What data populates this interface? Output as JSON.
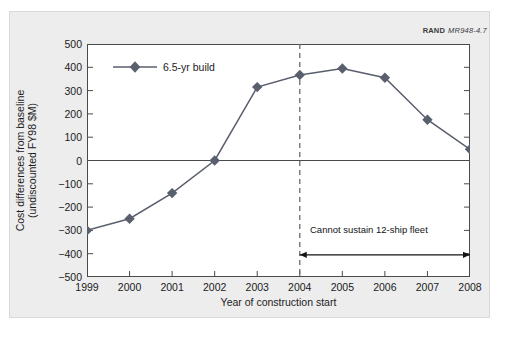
{
  "figure": {
    "credit_org": "RAND",
    "credit_number": "MR948-4.7",
    "background_color": "#ededed",
    "plot_background_color": "#ffffff"
  },
  "chart_data": {
    "type": "line",
    "title": "",
    "xlabel": "Year of construction start",
    "ylabel": "Cost differences from baseline (undiscounted FY98 $M)",
    "ylabel_line1": "Cost differences from baseline",
    "ylabel_line2": "(undiscounted FY98 $M)",
    "categories": [
      "1999",
      "2000",
      "2001",
      "2002",
      "2003",
      "2004",
      "2005",
      "2006",
      "2007",
      "2008"
    ],
    "x": [
      1999,
      2000,
      2001,
      2002,
      2003,
      2004,
      2005,
      2006,
      2007,
      2008
    ],
    "series": [
      {
        "name": "6.5-yr build",
        "values": [
          -300,
          -250,
          -140,
          0,
          315,
          367,
          395,
          355,
          175,
          48
        ],
        "color": "#5a5f6e",
        "marker": "diamond"
      }
    ],
    "ylim": [
      -500,
      500
    ],
    "yticks": [
      500,
      400,
      300,
      200,
      100,
      0,
      -100,
      -200,
      -300,
      -400,
      -500
    ],
    "ytick_labels": [
      "500",
      "400",
      "300",
      "200",
      "100",
      "0",
      "−100",
      "−200",
      "−300",
      "−400",
      "−500"
    ],
    "xlim": [
      1999,
      2008
    ],
    "xticks": [
      1999,
      2000,
      2001,
      2002,
      2003,
      2004,
      2005,
      2006,
      2007,
      2008
    ],
    "xtick_labels": [
      "1999",
      "2000",
      "2001",
      "2002",
      "2003",
      "2004",
      "2005",
      "2006",
      "2007",
      "2008"
    ],
    "grid": false,
    "zero_line": true,
    "legend": {
      "position": "top-left",
      "entries": [
        "6.5-yr build"
      ]
    },
    "annotations": [
      {
        "type": "vline",
        "x": 2004,
        "style": "dashed",
        "color": "#6b6b6b"
      },
      {
        "type": "arrow-span",
        "text": "Cannot sustain 12-ship fleet",
        "x_start": 2004,
        "x_end": 2008,
        "y": -405,
        "double_headed": true
      }
    ]
  }
}
